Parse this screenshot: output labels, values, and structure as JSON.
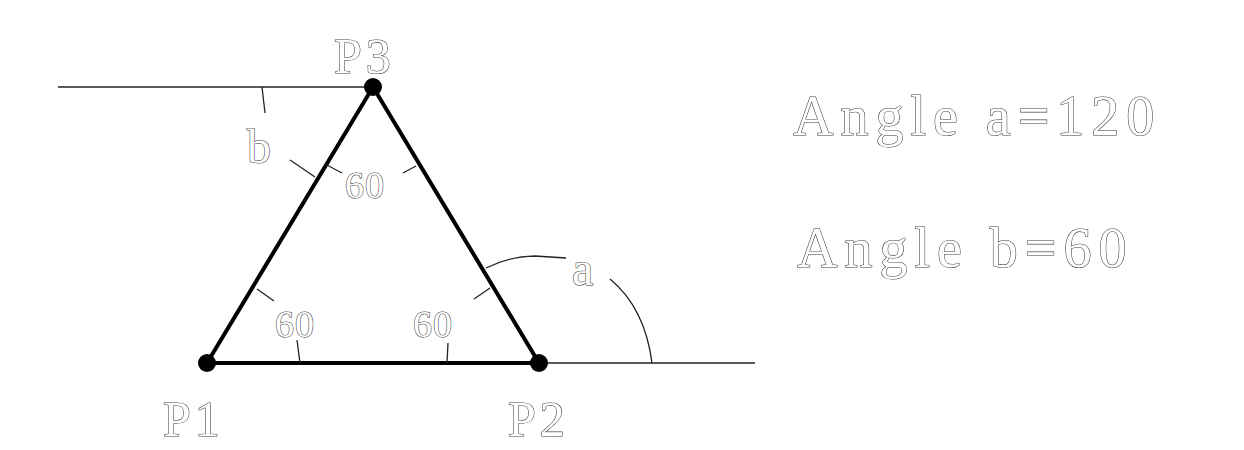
{
  "diagram": {
    "colors": {
      "line": "#000000",
      "text_outline": "#3a3a3a",
      "background": "#ffffff"
    },
    "points": [
      {
        "id": "P1",
        "label": "P1",
        "x": 207,
        "y": 363
      },
      {
        "id": "P2",
        "label": "P2",
        "x": 539,
        "y": 363
      },
      {
        "id": "P3",
        "label": "P3",
        "x": 373,
        "y": 87
      }
    ],
    "interior_angles": [
      {
        "vertex": "P1",
        "label": "60"
      },
      {
        "vertex": "P2",
        "label": "60"
      },
      {
        "vertex": "P3",
        "label": "60"
      }
    ],
    "named_angles": {
      "a": {
        "label": "a",
        "vertex": "P2",
        "value": "120"
      },
      "b": {
        "label": "b",
        "vertex": "P3",
        "value": "60"
      }
    },
    "reference_lines": [
      {
        "name": "top-horizontal",
        "x1": 58,
        "y1": 87,
        "x2": 373,
        "y2": 87
      },
      {
        "name": "bottom-extension",
        "x1": 539,
        "y1": 363,
        "x2": 755,
        "y2": 363
      }
    ],
    "results": [
      {
        "text": "Angle a=120"
      },
      {
        "text": "Angle b=60"
      }
    ]
  }
}
